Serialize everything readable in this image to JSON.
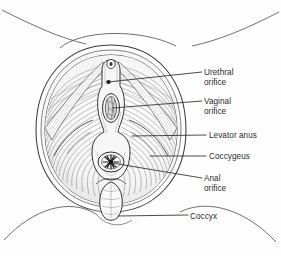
{
  "figure": {
    "kind": "anatomical-illustration",
    "background_color": "#fefefe",
    "ink_color": "#2b2b2b",
    "line_color": "#3a3a3a",
    "text_color": "#2b2b2b"
  },
  "labels": {
    "urethral_orifice": "Urethral\norifice",
    "vaginal_orifice": "Vaginal\norifice",
    "levator_anus": "Levator anus",
    "coccygeus": "Coccygeus",
    "anal_orifice": "Anal\norifice",
    "coccyx": "Coccyx"
  },
  "structures": [
    {
      "name": "urethral-orifice",
      "label": "Urethral orifice",
      "point": [
        108,
        82
      ]
    },
    {
      "name": "vaginal-orifice",
      "label": "Vaginal orifice",
      "point": [
        111,
        108
      ]
    },
    {
      "name": "levator-anus",
      "label": "Levator anus",
      "point": [
        135,
        136
      ]
    },
    {
      "name": "coccygeus",
      "label": "Coccygeus",
      "point": [
        152,
        156
      ]
    },
    {
      "name": "anal-orifice",
      "label": "Anal orifice",
      "point": [
        112,
        162
      ]
    },
    {
      "name": "coccyx",
      "label": "Coccyx",
      "point": [
        116,
        213
      ]
    }
  ],
  "leader_lines": [
    {
      "name": "leader-urethral",
      "from": [
        108,
        82
      ],
      "to": [
        202,
        72
      ]
    },
    {
      "name": "leader-vaginal",
      "from": [
        113,
        108
      ],
      "to": [
        202,
        101
      ]
    },
    {
      "name": "leader-levator",
      "from": [
        132,
        136
      ],
      "to": [
        206,
        135
      ]
    },
    {
      "name": "leader-coccygeus",
      "from": [
        150,
        156
      ],
      "to": [
        206,
        156
      ]
    },
    {
      "name": "leader-anal",
      "from": [
        112,
        163
      ],
      "to": [
        202,
        178
      ]
    },
    {
      "name": "leader-coccyx",
      "from": [
        118,
        216
      ],
      "to": [
        188,
        216
      ]
    }
  ]
}
